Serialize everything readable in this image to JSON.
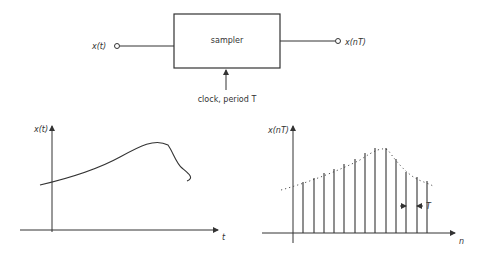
{
  "block_diagram": {
    "input_label": "x(t)",
    "block_label": "sampler",
    "output_label": "x(nT)",
    "clock_label": "clock, period T"
  },
  "continuous_plot": {
    "y_label": "x(t)",
    "x_label": "t"
  },
  "sampled_plot": {
    "y_label": "x(nT)",
    "x_label": "n",
    "period_label": "T",
    "sample_count": 13
  },
  "colors": {
    "stroke": "#333333",
    "background": "#ffffff"
  }
}
